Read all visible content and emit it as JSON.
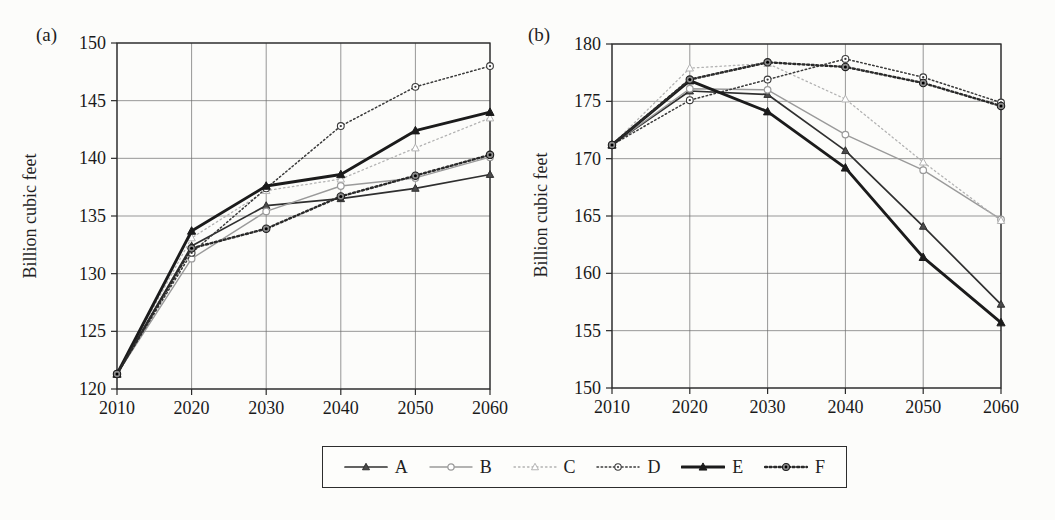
{
  "page": {
    "background": "#fcfcfa"
  },
  "panel_labels": {
    "a": "(a)",
    "b": "(b)"
  },
  "chart_data": [
    {
      "type": "line",
      "panel_label": "(a)",
      "ylabel": "Billion cubic feet",
      "xlabel": "",
      "x": [
        2010,
        2020,
        2030,
        2040,
        2050,
        2060
      ],
      "xticks": [
        "2010",
        "2020",
        "2030",
        "2040",
        "2050",
        "2060"
      ],
      "ylim": [
        120,
        150
      ],
      "yticks": [
        120,
        125,
        130,
        135,
        140,
        145,
        150
      ],
      "grid": true,
      "legend_position": "bottom-shared",
      "series": [
        {
          "name": "A",
          "values": [
            121.3,
            132.4,
            135.9,
            136.5,
            137.4,
            138.6
          ]
        },
        {
          "name": "B",
          "values": [
            121.3,
            131.3,
            135.4,
            137.6,
            138.3,
            140.1
          ]
        },
        {
          "name": "C",
          "values": [
            121.3,
            133.1,
            137.2,
            138.2,
            140.9,
            143.5
          ]
        },
        {
          "name": "D",
          "values": [
            121.3,
            131.8,
            137.4,
            142.8,
            146.2,
            148.0
          ]
        },
        {
          "name": "E",
          "values": [
            121.3,
            133.7,
            137.6,
            138.6,
            142.4,
            144.0
          ]
        },
        {
          "name": "F",
          "values": [
            121.3,
            132.2,
            133.9,
            136.7,
            138.5,
            140.3
          ]
        }
      ]
    },
    {
      "type": "line",
      "panel_label": "(b)",
      "ylabel": "Billion cubic feet",
      "xlabel": "",
      "x": [
        2010,
        2020,
        2030,
        2040,
        2050,
        2060
      ],
      "xticks": [
        "2010",
        "2020",
        "2030",
        "2040",
        "2050",
        "2060"
      ],
      "ylim": [
        150,
        180
      ],
      "yticks": [
        150,
        155,
        160,
        165,
        170,
        175,
        180
      ],
      "grid": true,
      "legend_position": "bottom-shared",
      "series": [
        {
          "name": "A",
          "values": [
            171.2,
            175.9,
            175.6,
            170.7,
            164.1,
            157.3
          ]
        },
        {
          "name": "B",
          "values": [
            171.2,
            176.1,
            176.0,
            172.1,
            169.0,
            164.7
          ]
        },
        {
          "name": "C",
          "values": [
            171.2,
            177.9,
            178.3,
            175.2,
            169.7,
            164.6
          ]
        },
        {
          "name": "D",
          "values": [
            171.2,
            175.1,
            176.9,
            178.7,
            177.1,
            174.9
          ]
        },
        {
          "name": "E",
          "values": [
            171.2,
            176.8,
            174.1,
            169.2,
            161.4,
            155.7
          ]
        },
        {
          "name": "F",
          "values": [
            171.2,
            176.9,
            178.4,
            178.0,
            176.6,
            174.6
          ]
        }
      ]
    }
  ],
  "series_styles": {
    "A": {
      "color": "#2f2f2f",
      "dash": "",
      "width": 1.7,
      "marker": "triangle-dark"
    },
    "B": {
      "color": "#9a9a9a",
      "dash": "",
      "width": 1.4,
      "marker": "circle-open"
    },
    "C": {
      "color": "#b3b3b3",
      "dash": "1.5,3",
      "width": 1.3,
      "marker": "triangle-open"
    },
    "D": {
      "color": "#3a3a3a",
      "dash": "1.5,2.6",
      "width": 1.5,
      "marker": "circle-dot"
    },
    "E": {
      "color": "#1b1b1b",
      "dash": "",
      "width": 2.9,
      "marker": "triangle-filled"
    },
    "F": {
      "color": "#2a2a2a",
      "dash": "2,2.6",
      "width": 2.4,
      "marker": "bullseye"
    }
  },
  "axis_colors": {
    "grid": "#6b6b6b",
    "frame": "#2a2a2a",
    "tick_label": "#1a1a1a"
  }
}
